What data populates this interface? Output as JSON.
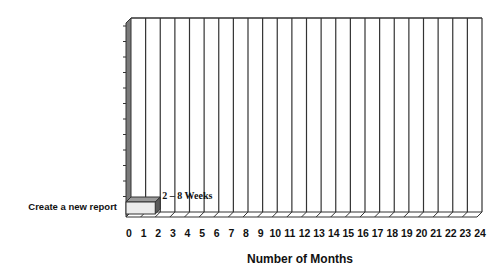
{
  "chart_data": {
    "type": "bar",
    "subtype": "horizontal-3d-gantt",
    "title": "",
    "xlabel": "Number of Months",
    "ylabel": "",
    "xlim": [
      0,
      24
    ],
    "x_ticks": [
      "0",
      "1",
      "2",
      "3",
      "4",
      "5",
      "6",
      "7",
      "8",
      "9",
      "10",
      "11",
      "12",
      "13",
      "14",
      "15",
      "16",
      "17",
      "18",
      "19",
      "20",
      "21",
      "22",
      "23",
      "24"
    ],
    "grid": true,
    "legend": null,
    "categories": [
      "Create a new report"
    ],
    "series": [
      {
        "name": "Duration",
        "start": [
          0
        ],
        "end": [
          2
        ],
        "values": [
          2
        ]
      }
    ],
    "annotations": [
      {
        "text": "2 – 8 Weeks",
        "x": 2,
        "category": "Create a new report"
      }
    ],
    "colors": {
      "bar_front": "#ececec",
      "bar_top": "#9a9a9a",
      "bar_side": "#5a5a5a",
      "wall": "#7a7a7a",
      "grid": "#333333"
    }
  }
}
